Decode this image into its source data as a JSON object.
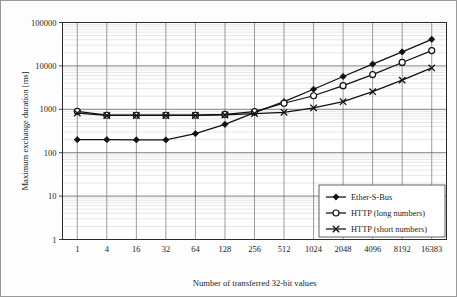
{
  "chart_data": {
    "type": "line",
    "title": "",
    "xlabel": "Number of transferred 32-bit values",
    "ylabel": "Maximum exchange duration [ms]",
    "x_scale": "category",
    "y_scale": "log",
    "ylim": [
      1,
      100000
    ],
    "grid": true,
    "legend_position": "bottom-right",
    "categories": [
      "1",
      "4",
      "16",
      "32",
      "64",
      "128",
      "256",
      "512",
      "1024",
      "2048",
      "4096",
      "8192",
      "16383"
    ],
    "y_ticks": [
      "1",
      "10",
      "100",
      "1000",
      "10000",
      "100000"
    ],
    "series": [
      {
        "name": "Ether-S-Bus",
        "marker": "filled-diamond",
        "values": [
          200,
          200,
          198,
          197,
          275,
          450,
          840,
          1500,
          2900,
          5700,
          11000,
          21000,
          41000
        ]
      },
      {
        "name": "HTTP (long numbers)",
        "marker": "open-circle",
        "values": [
          900,
          730,
          730,
          730,
          730,
          760,
          880,
          1380,
          2050,
          3500,
          6300,
          12000,
          22500
        ]
      },
      {
        "name": "HTTP (short numbers)",
        "marker": "cross-x",
        "values": [
          820,
          720,
          720,
          720,
          720,
          740,
          800,
          850,
          1080,
          1500,
          2550,
          4700,
          9000
        ]
      }
    ]
  },
  "axis": {
    "x_title": "Number of transferred 32-bit values",
    "y_title": "Maximum exchange duration [ms]"
  },
  "legend": {
    "entries": [
      {
        "label": "Ether-S-Bus",
        "marker": "filled-diamond"
      },
      {
        "label": "HTTP (long numbers)",
        "marker": "open-circle"
      },
      {
        "label": "HTTP (short numbers)",
        "marker": "cross-x"
      }
    ]
  },
  "colors": {
    "series": "#111111",
    "major_grid": "#4a4a4a",
    "minor_grid": "#c8c8c8",
    "background": "#ffffff"
  }
}
